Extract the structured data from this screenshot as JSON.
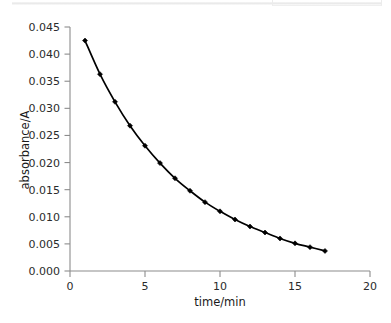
{
  "figure": {
    "name": "absorbance-decay-plot",
    "background_color": "#ffffff",
    "line_color": "#000000",
    "axis_color": "#8c8c8c",
    "text_color": "#2b2b2b"
  },
  "chart_data": {
    "type": "line",
    "title": "",
    "subtitle": "",
    "xlabel": "time/min",
    "ylabel": "absorbance/A",
    "xlim": [
      0,
      20
    ],
    "ylim": [
      0.0,
      0.045
    ],
    "xticks": [
      0,
      5,
      10,
      15,
      20
    ],
    "xtick_labels": [
      "0",
      "5",
      "10",
      "15",
      "20"
    ],
    "yticks": [
      0.0,
      0.005,
      0.01,
      0.015,
      0.02,
      0.025,
      0.03,
      0.035,
      0.04,
      0.045
    ],
    "ytick_labels": [
      "0.000",
      "0.005",
      "0.010",
      "0.015",
      "0.020",
      "0.025",
      "0.030",
      "0.035",
      "0.040",
      "0.045"
    ],
    "grid": false,
    "legend": null,
    "legend_position": "none",
    "marker": "filled-diamond",
    "series": [
      {
        "name": "absorbance",
        "x": [
          1,
          2,
          3,
          4,
          5,
          6,
          7,
          8,
          9,
          10,
          11,
          12,
          13,
          14,
          15,
          16,
          17
        ],
        "values": [
          0.0425,
          0.0363,
          0.0312,
          0.0268,
          0.0231,
          0.0199,
          0.0171,
          0.0148,
          0.0127,
          0.011,
          0.0095,
          0.0082,
          0.0071,
          0.006,
          0.0051,
          0.0044,
          0.0037
        ]
      }
    ],
    "annotations": []
  }
}
